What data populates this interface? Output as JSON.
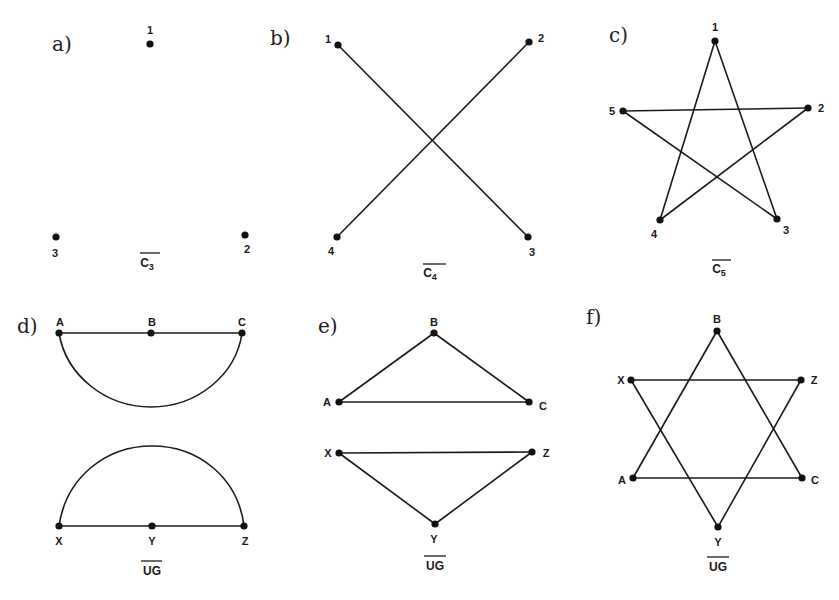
{
  "panels": [
    {
      "id": "a",
      "label": "a)",
      "caption": {
        "main": "C",
        "sub": "3",
        "overline": true
      },
      "nodes": [
        {
          "id": "1",
          "label": "1",
          "x": 150,
          "y": 44
        },
        {
          "id": "2",
          "label": "2",
          "x": 245,
          "y": 235
        },
        {
          "id": "3",
          "label": "3",
          "x": 56,
          "y": 237
        }
      ],
      "edges": []
    },
    {
      "id": "b",
      "label": "b)",
      "caption": {
        "main": "C",
        "sub": "4",
        "overline": true
      },
      "nodes": [
        {
          "id": "1",
          "label": "1",
          "x": 338,
          "y": 45
        },
        {
          "id": "2",
          "label": "2",
          "x": 529,
          "y": 42
        },
        {
          "id": "3",
          "label": "3",
          "x": 528,
          "y": 237
        },
        {
          "id": "4",
          "label": "4",
          "x": 337,
          "y": 237
        }
      ],
      "edges": [
        [
          "1",
          "3"
        ],
        [
          "2",
          "4"
        ]
      ]
    },
    {
      "id": "c",
      "label": "c)",
      "caption": {
        "main": "C",
        "sub": "5",
        "overline": true
      },
      "nodes": [
        {
          "id": "1",
          "label": "1",
          "x": 715,
          "y": 41
        },
        {
          "id": "2",
          "label": "2",
          "x": 808,
          "y": 108
        },
        {
          "id": "3",
          "label": "3",
          "x": 777,
          "y": 219
        },
        {
          "id": "4",
          "label": "4",
          "x": 660,
          "y": 220
        },
        {
          "id": "5",
          "label": "5",
          "x": 623,
          "y": 111
        }
      ],
      "edges": [
        [
          "1",
          "3"
        ],
        [
          "1",
          "4"
        ],
        [
          "5",
          "2"
        ],
        [
          "5",
          "3"
        ],
        [
          "2",
          "4"
        ]
      ]
    },
    {
      "id": "d",
      "label": "d)",
      "caption": {
        "main": "UG",
        "sub": "",
        "overline": true
      },
      "nodes": [
        {
          "id": "A",
          "label": "A",
          "x": 59,
          "y": 333
        },
        {
          "id": "B",
          "label": "B",
          "x": 151,
          "y": 333
        },
        {
          "id": "C",
          "label": "C",
          "x": 242,
          "y": 333
        },
        {
          "id": "X",
          "label": "X",
          "x": 59,
          "y": 526
        },
        {
          "id": "Y",
          "label": "Y",
          "x": 152,
          "y": 526
        },
        {
          "id": "Z",
          "label": "Z",
          "x": 244,
          "y": 526
        }
      ],
      "edges": [
        [
          "A",
          "B"
        ],
        [
          "B",
          "C"
        ],
        [
          "A",
          "C",
          "arc-down"
        ],
        [
          "X",
          "Y"
        ],
        [
          "Y",
          "Z"
        ],
        [
          "X",
          "Z",
          "arc-up"
        ]
      ]
    },
    {
      "id": "e",
      "label": "e)",
      "caption": {
        "main": "UG",
        "sub": "",
        "overline": true
      },
      "nodes": [
        {
          "id": "A",
          "label": "A",
          "x": 339,
          "y": 402
        },
        {
          "id": "B",
          "label": "B",
          "x": 434,
          "y": 333
        },
        {
          "id": "C",
          "label": "C",
          "x": 529,
          "y": 402
        },
        {
          "id": "X",
          "label": "X",
          "x": 339,
          "y": 453
        },
        {
          "id": "Y",
          "label": "Y",
          "x": 435,
          "y": 524
        },
        {
          "id": "Z",
          "label": "Z",
          "x": 532,
          "y": 452
        }
      ],
      "edges": [
        [
          "A",
          "B"
        ],
        [
          "B",
          "C"
        ],
        [
          "A",
          "C"
        ],
        [
          "X",
          "Z"
        ],
        [
          "X",
          "Y"
        ],
        [
          "Y",
          "Z"
        ]
      ]
    },
    {
      "id": "f",
      "label": "f)",
      "caption": {
        "main": "UG",
        "sub": "",
        "overline": true
      },
      "nodes": [
        {
          "id": "B",
          "label": "B",
          "x": 717,
          "y": 331
        },
        {
          "id": "X",
          "label": "X",
          "x": 631,
          "y": 380
        },
        {
          "id": "Z",
          "label": "Z",
          "x": 801,
          "y": 380
        },
        {
          "id": "A",
          "label": "A",
          "x": 633,
          "y": 478
        },
        {
          "id": "C",
          "label": "C",
          "x": 802,
          "y": 478
        },
        {
          "id": "Y",
          "label": "Y",
          "x": 718,
          "y": 527
        }
      ],
      "edges": [
        [
          "B",
          "A"
        ],
        [
          "B",
          "C"
        ],
        [
          "A",
          "C"
        ],
        [
          "X",
          "Z"
        ],
        [
          "X",
          "Y"
        ],
        [
          "Z",
          "Y"
        ]
      ]
    }
  ]
}
